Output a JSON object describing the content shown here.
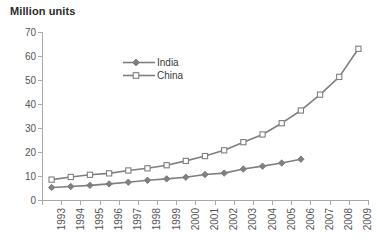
{
  "chart_data": {
    "type": "line",
    "title": "Million units",
    "xlabel": "",
    "ylabel": "",
    "ylim": [
      0,
      70
    ],
    "ytick_step": 10,
    "yticks": [
      70,
      60,
      50,
      40,
      30,
      20,
      10,
      0
    ],
    "grid": false,
    "legend_position": "inside-upper-left",
    "x_tick_rotation": -90,
    "categories": [
      "1993",
      "1994",
      "1995",
      "1996",
      "1997",
      "1998",
      "1999",
      "2000",
      "2001",
      "2002",
      "2003",
      "2004",
      "2005",
      "2006",
      "2007",
      "2008",
      "2009"
    ],
    "series": [
      {
        "name": "India",
        "marker": "filled-diamond",
        "color": "#7f7f7f",
        "values": [
          5.2,
          5.6,
          6.1,
          6.7,
          7.4,
          8.2,
          8.8,
          9.5,
          10.6,
          11.2,
          12.9,
          14.1,
          15.4,
          17.0,
          null,
          null,
          null
        ]
      },
      {
        "name": "China",
        "marker": "hollow-square",
        "color": "#7f7f7f",
        "values": [
          8.5,
          9.6,
          10.5,
          11.1,
          12.3,
          13.2,
          14.5,
          16.3,
          18.3,
          20.7,
          24.1,
          27.3,
          32.0,
          37.3,
          43.9,
          51.3,
          63.0
        ]
      }
    ]
  },
  "legend": {
    "entries": [
      {
        "label": "India"
      },
      {
        "label": "China"
      }
    ]
  },
  "colors": {
    "series": "#7f7f7f",
    "axis": "#a8a8a8",
    "text": "#555555",
    "title": "#2b2b2b",
    "background": "#ffffff"
  }
}
